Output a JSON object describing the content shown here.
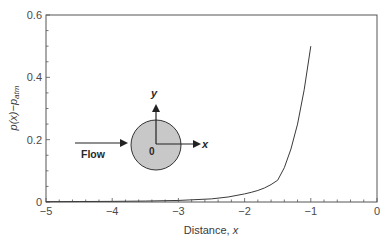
{
  "chart_data": {
    "type": "line",
    "title": "",
    "xlabel": "Distance, x",
    "xlabel_main": "Distance, ",
    "xlabel_var": "x",
    "ylabel": "p(x)−p_atm",
    "xlim": [
      -5,
      0
    ],
    "ylim": [
      0,
      0.6
    ],
    "grid": false,
    "legend": null,
    "x_ticks": [
      -5,
      -4,
      -3,
      -2,
      -1,
      0
    ],
    "x_tick_labels": [
      "−5",
      "−4",
      "−3",
      "−2",
      "−1",
      "0"
    ],
    "y_ticks": [
      0,
      0.2,
      0.4,
      0.6
    ],
    "y_tick_labels": [
      "0",
      "0.2",
      "0.4",
      "0.6"
    ],
    "series": [
      {
        "name": "p(x) - p_atm",
        "color": "#3a3a3a",
        "x": [
          -5.0,
          -4.5,
          -4.0,
          -3.5,
          -3.0,
          -2.5,
          -2.25,
          -2.0,
          -1.9,
          -1.8,
          -1.7,
          -1.6,
          -1.5,
          -1.4,
          -1.3,
          -1.2,
          -1.1,
          -1.0
        ],
        "values": [
          0.001,
          0.0015,
          0.002,
          0.003,
          0.005,
          0.01,
          0.016,
          0.026,
          0.031,
          0.037,
          0.045,
          0.056,
          0.07,
          0.11,
          0.17,
          0.25,
          0.36,
          0.5
        ]
      }
    ],
    "annotations": {
      "flow_label": "Flow",
      "origin_label": "0",
      "x_axis_label": "x",
      "y_axis_label": "y",
      "cylinder_fill": "#c8c8c8"
    }
  }
}
